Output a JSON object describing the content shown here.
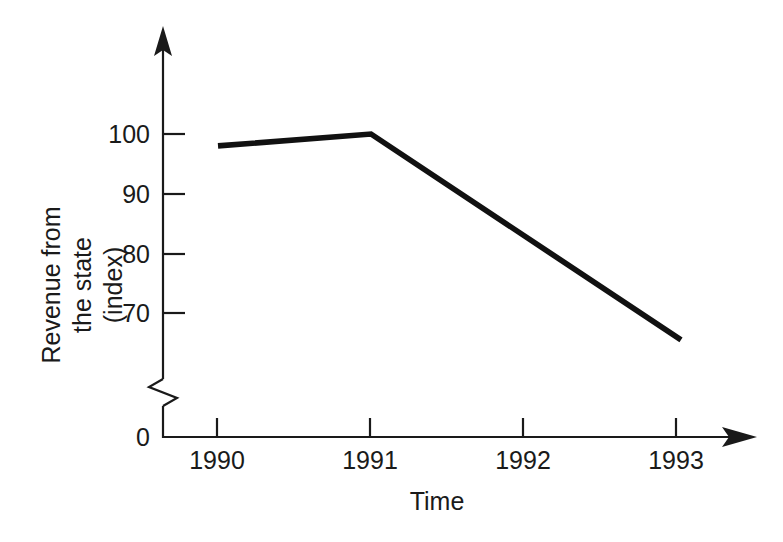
{
  "chart_data": {
    "type": "line",
    "title": "",
    "xlabel": "Time",
    "ylabel": "Revenue from the state (index)",
    "ylabel_lines": [
      "Revenue from",
      "the state",
      "(index)"
    ],
    "x": [
      "1990",
      "1991",
      "1992",
      "1993"
    ],
    "categories": [
      "1990",
      "1991",
      "1992",
      "1993"
    ],
    "series": [
      {
        "name": "Revenue from the state (index)",
        "values": [
          98,
          100,
          83,
          65.5
        ],
        "color": "#111111"
      }
    ],
    "values": [
      98,
      100,
      83,
      65.5
    ],
    "vertices": [
      {
        "x": "1990",
        "y": 98
      },
      {
        "x": "1991",
        "y": 100
      },
      {
        "x": "1993",
        "y": 65.5
      }
    ],
    "y_ticks": [
      "0",
      "70",
      "80",
      "90",
      "100"
    ],
    "y_tick_values": [
      0,
      70,
      80,
      90,
      100
    ],
    "x_ticks": [
      "1990",
      "1991",
      "1992",
      "1993"
    ],
    "ylim": [
      65,
      103
    ],
    "axis_break": true,
    "axis_break_label": "zigzag-break-between-0-and-70",
    "grid": false,
    "legend": false,
    "legend_position": "none",
    "x_axis_arrow": true,
    "y_axis_arrow": true,
    "background_color": "#ffffff",
    "axis_color": "#1a1a1a"
  },
  "axes": {
    "y": {
      "tick_100": "100",
      "tick_90": "90",
      "tick_80": "80",
      "tick_70": "70",
      "tick_0": "0",
      "title_line1": "Revenue from",
      "title_line2": "the state",
      "title_line3": "(index)"
    },
    "x": {
      "tick_1990": "1990",
      "tick_1991": "1991",
      "tick_1992": "1992",
      "tick_1993": "1993",
      "title": "Time"
    }
  }
}
